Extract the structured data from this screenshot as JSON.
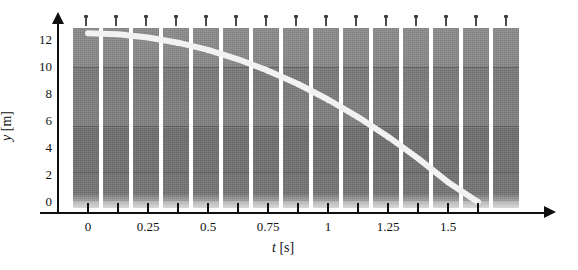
{
  "figure": {
    "kind": "strobe-photograph-graph",
    "background": "#ffffff",
    "curve_color": "#f2f2f2",
    "axis_color": "#101010",
    "strip_color": "#828282"
  },
  "axes": {
    "y_title_symbol": "y",
    "y_title_unit": " [m]",
    "x_title_symbol": "t",
    "x_title_unit": " [s]",
    "y_ticks": [
      0,
      2,
      4,
      6,
      8,
      10,
      12
    ],
    "y_tick_labels": [
      "0",
      "2",
      "4",
      "6",
      "8",
      "10",
      "12"
    ],
    "x_tick_values": [
      0,
      0.125,
      0.25,
      0.375,
      0.5,
      0.625,
      0.75,
      0.875,
      1,
      1.125,
      1.25,
      1.375,
      1.5,
      1.625
    ],
    "x_tick_labels_shown": [
      "0",
      "0.25",
      "0.5",
      "0.75",
      "1",
      "1.25",
      "1.5"
    ],
    "x_labeled_values": [
      0,
      0.25,
      0.5,
      0.75,
      1,
      1.25,
      1.5
    ],
    "ylim": [
      0,
      13.2
    ],
    "xlim": [
      -0.07,
      1.78
    ],
    "grid": false
  },
  "chart_data": {
    "type": "line",
    "title": "",
    "subtitle": "",
    "xlabel": "t [s]",
    "ylabel": "y [m]",
    "xlim": [
      -0.07,
      1.78
    ],
    "ylim": [
      0,
      13.2
    ],
    "grid": false,
    "legend": "none",
    "annotations": [
      "Strobe photograph strips of a falling ball, one strip per 0.125 s",
      "White parabolic curve traces the ball height y(t)"
    ],
    "series": [
      {
        "name": "Ball height y(t)",
        "color": "#f2f2f2",
        "x": [
          0,
          0.125,
          0.25,
          0.375,
          0.5,
          0.625,
          0.75,
          0.875,
          1,
          1.125,
          1.25,
          1.375,
          1.5,
          1.625
        ],
        "values": [
          12.5,
          12.42,
          12.19,
          11.8,
          11.27,
          10.57,
          9.73,
          8.74,
          7.59,
          6.29,
          4.84,
          3.23,
          1.47,
          0.0
        ]
      }
    ],
    "ball_markers": {
      "name": "Ball image in each strobe strip",
      "x": [
        0,
        0.125,
        0.25,
        0.375,
        0.5,
        0.625,
        0.75,
        0.875,
        1,
        1.125,
        1.25,
        1.375,
        1.5,
        1.625
      ],
      "values": [
        12.5,
        12.42,
        12.19,
        11.8,
        11.27,
        10.57,
        9.73,
        8.74,
        7.59,
        6.29,
        4.84,
        3.23,
        1.47,
        0.1
      ]
    },
    "strips": {
      "count": 15,
      "period_seconds": 0.125,
      "first_strip_time": 0
    }
  }
}
